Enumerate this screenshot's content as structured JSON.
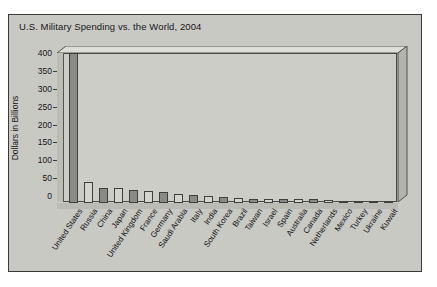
{
  "chart_data": {
    "type": "bar",
    "title": "U.S. Military Spending vs. the World, 2004",
    "xlabel": "",
    "ylabel": "Dollars in Billions",
    "ylim": [
      0,
      400
    ],
    "yticks": [
      0,
      50,
      100,
      150,
      200,
      250,
      300,
      350,
      400
    ],
    "grid": false,
    "legend": null,
    "categories": [
      "United States",
      "Russia",
      "China",
      "Japan",
      "United Kingdom",
      "France",
      "Germany",
      "Saudi Arabia",
      "Italy",
      "India",
      "South Korea",
      "Brazil",
      "Taiwan",
      "Israel",
      "Spain",
      "Australia",
      "Canada",
      "Netherlands",
      "Mexico",
      "Turkey",
      "Ukraine",
      "Kuwait"
    ],
    "values": [
      455,
      59,
      42,
      41,
      37,
      33,
      30,
      25,
      22,
      20,
      16,
      14,
      12,
      11,
      10,
      10,
      10,
      9,
      7,
      6,
      5,
      4
    ],
    "value_note": "United States bar is clipped at the top of the 0-400 axis",
    "bar_colors": [
      "#8a8a86",
      "#d4d4cf"
    ]
  },
  "palette": {
    "panel_background": "#c9c9c4",
    "plot_background": "#cdcdc8",
    "frame_border": "#3a3a38",
    "bar_dark": "#8a8a86",
    "bar_light": "#d4d4cf",
    "text": "#16161a"
  }
}
